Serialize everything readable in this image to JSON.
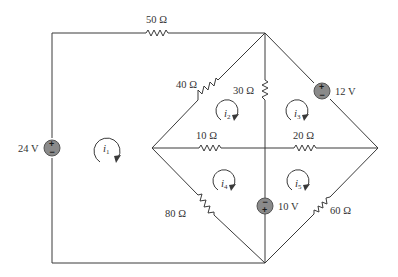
{
  "diagram": {
    "type": "circuit-schematic",
    "resistors": [
      {
        "id": "R50",
        "label": "50 Ω"
      },
      {
        "id": "R40",
        "label": "40 Ω"
      },
      {
        "id": "R30",
        "label": "30 Ω"
      },
      {
        "id": "R10",
        "label": "10 Ω"
      },
      {
        "id": "R20",
        "label": "20 Ω"
      },
      {
        "id": "R80",
        "label": "80 Ω"
      },
      {
        "id": "R60",
        "label": "60 Ω"
      }
    ],
    "sources": [
      {
        "id": "V24",
        "label": "24 V",
        "plus": "+",
        "minus": "−"
      },
      {
        "id": "V12",
        "label": "12 V",
        "plus": "+",
        "minus": "−"
      },
      {
        "id": "V10",
        "label": "10 V",
        "plus": "+",
        "minus": "−"
      }
    ],
    "mesh_currents": [
      {
        "id": "i1",
        "symbol": "i",
        "sub": "1"
      },
      {
        "id": "i2",
        "symbol": "i",
        "sub": "2"
      },
      {
        "id": "i3",
        "symbol": "i",
        "sub": "3"
      },
      {
        "id": "i4",
        "symbol": "i",
        "sub": "4"
      },
      {
        "id": "i5",
        "symbol": "i",
        "sub": "5"
      }
    ]
  }
}
